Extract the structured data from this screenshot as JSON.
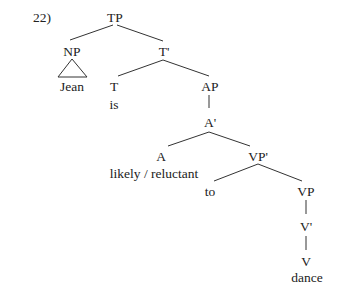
{
  "example_number": "22)",
  "tree": {
    "nodes": {
      "tp": "TP",
      "np": "NP",
      "jean": "Jean",
      "t_bar": "T'",
      "t": "T",
      "is": "is",
      "ap": "AP",
      "a_bar": "A'",
      "a": "A",
      "likely_reluctant": "likely / reluctant",
      "vp_bar": "VP'",
      "to": "to",
      "vp": "VP",
      "v_bar": "V'",
      "v": "V",
      "dance": "dance"
    },
    "colors": {
      "line": "#333333",
      "text": "#222222"
    }
  }
}
